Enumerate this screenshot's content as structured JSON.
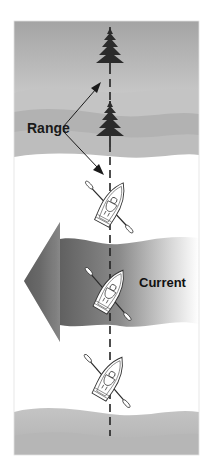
{
  "figure": {
    "kind": "illustration",
    "labels": {
      "range": "Range",
      "current": "Current"
    },
    "elements": {
      "range_marks": [
        {
          "name": "far-tree",
          "position": "top"
        },
        {
          "name": "near-tree",
          "position": "middle"
        }
      ],
      "boats": [
        {
          "name": "rowboat-1",
          "position": "above current"
        },
        {
          "name": "rowboat-2",
          "position": "in current"
        },
        {
          "name": "rowboat-3",
          "position": "below current"
        }
      ],
      "range_line": "dashed vertical line through both trees and boats",
      "current_arrow_direction": "left"
    },
    "colors": {
      "sky": "#a6a6a6",
      "hills_light": "#c2c2c2",
      "hills_mid": "#acacac",
      "tree": "#2b2b2b",
      "current_dark": "#5a5a5a",
      "current_light": "#e8e8e8",
      "ink": "#1a1a1a",
      "frame": "#d0d0d0"
    }
  }
}
